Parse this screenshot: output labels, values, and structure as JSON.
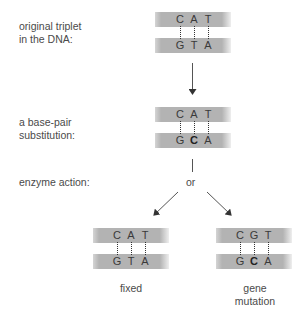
{
  "labels": {
    "original": [
      "original triplet",
      "in the DNA:"
    ],
    "substitution": [
      "a base-pair",
      "substitution:"
    ],
    "enzyme": "enzyme action:",
    "or": "or"
  },
  "pairs": {
    "original": {
      "top": [
        "C",
        "A",
        "T"
      ],
      "bottom": [
        "G",
        "T",
        "A"
      ],
      "bold_bottom": []
    },
    "substituted": {
      "top": [
        "C",
        "A",
        "T"
      ],
      "bottom": [
        "G",
        "C",
        "A"
      ],
      "bold_bottom": [
        1
      ]
    },
    "fixed": {
      "top": [
        "C",
        "A",
        "T"
      ],
      "bottom": [
        "G",
        "T",
        "A"
      ],
      "bold_bottom": []
    },
    "mutation": {
      "top": [
        "C",
        "G",
        "T"
      ],
      "bottom": [
        "G",
        "C",
        "A"
      ],
      "bold_bottom": [
        1
      ]
    }
  },
  "captions": {
    "fixed": "fixed",
    "mutation": [
      "gene",
      "mutation"
    ]
  },
  "colors": {
    "strand": "#b3b3b3",
    "text": "#4a4a4a",
    "arrow": "#333333"
  }
}
